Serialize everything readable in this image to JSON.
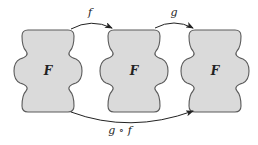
{
  "diagram": {
    "sets": [
      {
        "label": "F",
        "cx": 48
      },
      {
        "label": "F",
        "cx": 134
      },
      {
        "label": "F",
        "cx": 215
      }
    ],
    "arrows": [
      {
        "label": "f",
        "from": 0,
        "to": 1
      },
      {
        "label": "g",
        "from": 1,
        "to": 2
      },
      {
        "label": "g ∘ f",
        "from": 0,
        "to": 2
      }
    ],
    "colors": {
      "fill": "#dadada",
      "stroke": "#5a5a5a",
      "arrow": "#222222"
    }
  }
}
